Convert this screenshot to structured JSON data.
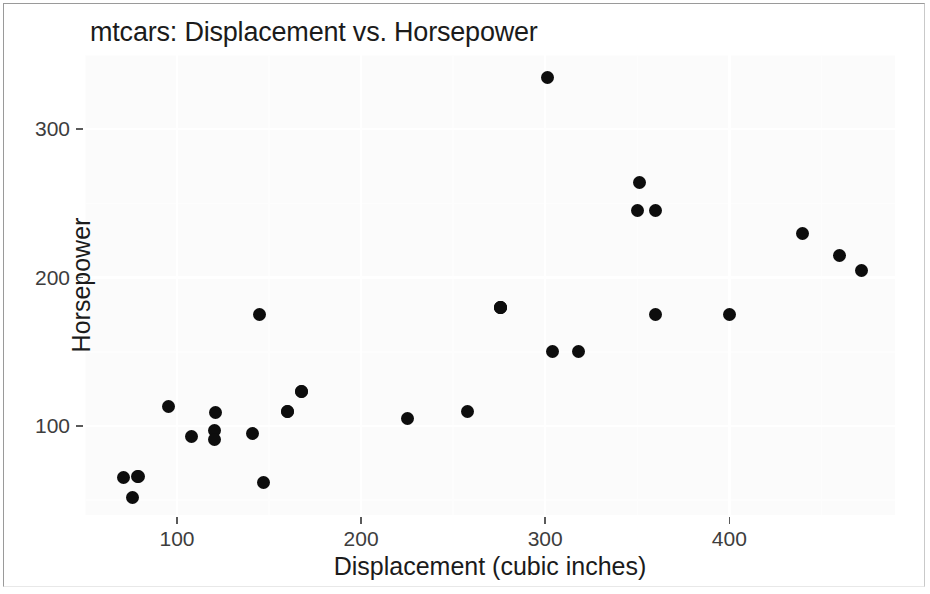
{
  "chart_data": {
    "type": "scatter",
    "title": "mtcars: Displacement vs. Horsepower",
    "xlabel": "Displacement (cubic inches)",
    "ylabel": "Horsepower",
    "xlim": [
      50,
      490
    ],
    "ylim": [
      40,
      350
    ],
    "xticks": [
      100,
      200,
      300,
      400
    ],
    "xtick_labels": [
      "100",
      "200",
      "300",
      "400"
    ],
    "yticks": [
      100,
      200,
      300
    ],
    "ytick_labels": [
      "100",
      "200",
      "300"
    ],
    "grid": true,
    "legend": "none",
    "point_color": "#0d0d0d",
    "panel_color": "#fbfbfb",
    "gridline_color": "#ffffff",
    "series": [
      {
        "name": "mtcars",
        "points": [
          {
            "x": 160.0,
            "y": 110
          },
          {
            "x": 160.0,
            "y": 110
          },
          {
            "x": 108.0,
            "y": 93
          },
          {
            "x": 258.0,
            "y": 110
          },
          {
            "x": 360.0,
            "y": 175
          },
          {
            "x": 225.0,
            "y": 105
          },
          {
            "x": 360.0,
            "y": 245
          },
          {
            "x": 146.7,
            "y": 62
          },
          {
            "x": 140.8,
            "y": 95
          },
          {
            "x": 167.6,
            "y": 123
          },
          {
            "x": 167.6,
            "y": 123
          },
          {
            "x": 275.8,
            "y": 180
          },
          {
            "x": 275.8,
            "y": 180
          },
          {
            "x": 275.8,
            "y": 180
          },
          {
            "x": 472.0,
            "y": 205
          },
          {
            "x": 460.0,
            "y": 215
          },
          {
            "x": 440.0,
            "y": 230
          },
          {
            "x": 78.7,
            "y": 66
          },
          {
            "x": 75.7,
            "y": 52
          },
          {
            "x": 71.1,
            "y": 65
          },
          {
            "x": 120.1,
            "y": 97
          },
          {
            "x": 318.0,
            "y": 150
          },
          {
            "x": 304.0,
            "y": 150
          },
          {
            "x": 350.0,
            "y": 245
          },
          {
            "x": 400.0,
            "y": 175
          },
          {
            "x": 79.0,
            "y": 66
          },
          {
            "x": 120.3,
            "y": 91
          },
          {
            "x": 95.1,
            "y": 113
          },
          {
            "x": 351.0,
            "y": 264
          },
          {
            "x": 145.0,
            "y": 175
          },
          {
            "x": 301.0,
            "y": 335
          },
          {
            "x": 121.0,
            "y": 109
          }
        ]
      }
    ]
  }
}
